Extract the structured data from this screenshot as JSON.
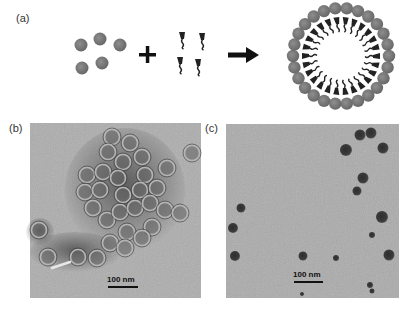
{
  "figure": {
    "panels": [
      {
        "id": "a",
        "label": "(a)",
        "description": "schematic: nanoparticles + surfactants -> micelle-encapsulated assembly"
      },
      {
        "id": "b",
        "label": "(b)",
        "description": "TEM image of hollow ring-like assemblies",
        "scale_bar": "100 nm"
      },
      {
        "id": "c",
        "label": "(c)",
        "description": "TEM image of dispersed nanoparticles",
        "scale_bar": "100 nm"
      }
    ],
    "schematic": {
      "operator_plus": "+",
      "operator_arrow": "→",
      "nanoparticle_color": "#7a7a7a",
      "surfactant_color": "#222222",
      "ring_sphere_count": 26
    },
    "colors": {
      "tem_b_background": "#a9a9a9",
      "tem_c_background": "#acacac",
      "particle_dark": "#3a3a3a"
    }
  }
}
